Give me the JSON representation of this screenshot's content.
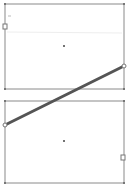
{
  "canvas": {
    "width": 128,
    "height": 186,
    "background": "#ffffff"
  },
  "shapes": {
    "top_rect": {
      "x": 5,
      "y": 4,
      "w": 119,
      "h": 85,
      "stroke": "#8a8a8a"
    },
    "bottom_rect": {
      "x": 5,
      "y": 101,
      "w": 119,
      "h": 82,
      "stroke": "#8a8a8a"
    },
    "connector": {
      "x1": 124,
      "y1": 66,
      "x2": 5,
      "y2": 125,
      "stroke": "#555555",
      "width": 3
    }
  },
  "handles": {
    "top_left_square": {
      "x": 5,
      "y": 26
    },
    "bottom_right_square": {
      "x": 123,
      "y": 157
    },
    "connector_start": {
      "x": 124,
      "y": 66
    },
    "connector_end": {
      "x": 5,
      "y": 125
    }
  },
  "centers": {
    "top": {
      "x": 64,
      "y": 46
    },
    "bottom": {
      "x": 64,
      "y": 141
    }
  },
  "colors": {
    "frame": "#8a8a8a",
    "line": "#555555",
    "handle_fill": "#ffffff",
    "handle_stroke": "#777777",
    "center_dot": "#444444"
  }
}
